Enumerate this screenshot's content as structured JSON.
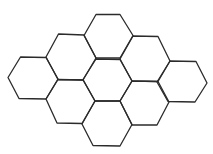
{
  "diagram": {
    "type": "hexagonal-tiling",
    "background": "#ffffff",
    "stroke_color": "#2b2b2b",
    "stroke_width": 1.3,
    "hexagon_count": 9,
    "hexagons": [
      {
        "id": "top",
        "points": [
          [
            96,
            14.5
          ],
          [
            120,
            14.5
          ],
          [
            133,
            35.5
          ],
          [
            120,
            58
          ],
          [
            96,
            58
          ],
          [
            84,
            35.5
          ]
        ]
      },
      {
        "id": "upper-left",
        "points": [
          [
            58.5,
            34
          ],
          [
            84,
            35
          ],
          [
            96,
            58
          ],
          [
            83,
            80
          ],
          [
            58,
            79.5
          ],
          [
            46,
            57
          ]
        ]
      },
      {
        "id": "upper-right",
        "points": [
          [
            133,
            36
          ],
          [
            158,
            36.5
          ],
          [
            170,
            61
          ],
          [
            158,
            81.5
          ],
          [
            132,
            81
          ],
          [
            120,
            59
          ]
        ]
      },
      {
        "id": "left",
        "points": [
          [
            20.5,
            57
          ],
          [
            46,
            57.5
          ],
          [
            58,
            79
          ],
          [
            46,
            99
          ],
          [
            19,
            98.5
          ],
          [
            8,
            77.5
          ]
        ]
      },
      {
        "id": "center",
        "points": [
          [
            96,
            59
          ],
          [
            120,
            59.5
          ],
          [
            132,
            81
          ],
          [
            120,
            101
          ],
          [
            95,
            101
          ],
          [
            83,
            79.5
          ]
        ]
      },
      {
        "id": "right",
        "points": [
          [
            170,
            61
          ],
          [
            196,
            61.5
          ],
          [
            207,
            83
          ],
          [
            195,
            102
          ],
          [
            168,
            101.5
          ],
          [
            157,
            82
          ]
        ]
      },
      {
        "id": "lower-left",
        "points": [
          [
            58,
            79.5
          ],
          [
            83,
            80
          ],
          [
            95,
            101
          ],
          [
            82,
            123.5
          ],
          [
            57,
            123
          ],
          [
            46,
            99
          ]
        ]
      },
      {
        "id": "lower-right",
        "points": [
          [
            132,
            81
          ],
          [
            158,
            81.5
          ],
          [
            169,
            102
          ],
          [
            157,
            125
          ],
          [
            132,
            125
          ],
          [
            120,
            101
          ]
        ]
      },
      {
        "id": "bottom",
        "points": [
          [
            95,
            101
          ],
          [
            120,
            101
          ],
          [
            132,
            124.5
          ],
          [
            120,
            146
          ],
          [
            93,
            145.5
          ],
          [
            82,
            124
          ]
        ]
      }
    ]
  }
}
